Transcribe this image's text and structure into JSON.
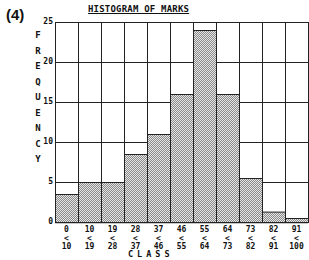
{
  "figure_label": "(4)",
  "chart_data": {
    "type": "bar",
    "title": "HISTOGRAM OF MARKS",
    "xlabel": "CLASS",
    "ylabel": "FREQUENCY",
    "categories": [
      {
        "lo": "0",
        "hi": "10"
      },
      {
        "lo": "10",
        "hi": "19"
      },
      {
        "lo": "19",
        "hi": "28"
      },
      {
        "lo": "28",
        "hi": "37"
      },
      {
        "lo": "37",
        "hi": "46"
      },
      {
        "lo": "46",
        "hi": "55"
      },
      {
        "lo": "55",
        "hi": "64"
      },
      {
        "lo": "64",
        "hi": "73"
      },
      {
        "lo": "73",
        "hi": "82"
      },
      {
        "lo": "82",
        "hi": "91"
      },
      {
        "lo": "91",
        "hi": "100"
      }
    ],
    "values": [
      3.5,
      5,
      5,
      8.5,
      11,
      16,
      24,
      16,
      5.5,
      1.3,
      0.5
    ],
    "yticks": [
      "25",
      "20",
      "15",
      "10",
      "5",
      "0"
    ],
    "ylim": [
      0,
      25
    ],
    "grid": true,
    "bin_separator": "<",
    "bar_fill": "#c8c8c8",
    "line_color": "#222222"
  }
}
